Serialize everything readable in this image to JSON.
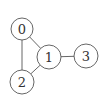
{
  "diagram": {
    "type": "undirected-graph",
    "nodes": [
      {
        "id": "0",
        "label": "0",
        "cx": 22,
        "cy": 29,
        "r": 11
      },
      {
        "id": "1",
        "label": "1",
        "cx": 49,
        "cy": 57,
        "r": 12
      },
      {
        "id": "2",
        "label": "2",
        "cx": 22,
        "cy": 82,
        "r": 12
      },
      {
        "id": "3",
        "label": "3",
        "cx": 86,
        "cy": 56,
        "r": 12
      }
    ],
    "edges": [
      {
        "from": "0",
        "to": "1"
      },
      {
        "from": "0",
        "to": "2"
      },
      {
        "from": "1",
        "to": "2"
      },
      {
        "from": "1",
        "to": "3"
      }
    ],
    "colors": {
      "stroke": "#555555",
      "fill": "#ffffff",
      "text": "#333333"
    }
  }
}
